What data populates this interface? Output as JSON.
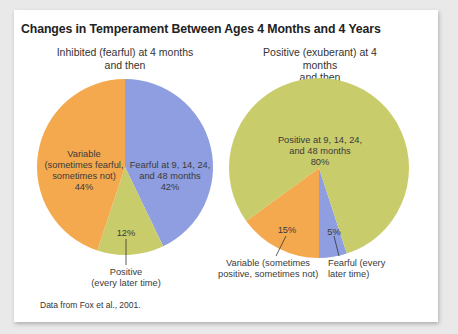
{
  "chart_data": [
    {
      "type": "pie",
      "title": "Changes in Temperament Between Ages 4 Months and 4 Years",
      "subtitle": "Inhibited (fearful) at 4 months and then",
      "slices": [
        {
          "label": "Fearful at 9, 14, 24, and 48 months",
          "value": 42,
          "color": "#8e9ee0"
        },
        {
          "label": "Positive (every later time)",
          "value": 12,
          "color": "#c9cc6a"
        },
        {
          "label": "Variable (sometimes fearful, sometimes not)",
          "value": 44,
          "color": "#f5a94e"
        }
      ]
    },
    {
      "type": "pie",
      "title": "Changes in Temperament Between Ages 4 Months and 4 Years",
      "subtitle": "Positive (exuberant) at 4 months and then",
      "slices": [
        {
          "label": "Positive at 9, 14, 24, and 48 months",
          "value": 80,
          "color": "#c9cc6a"
        },
        {
          "label": "Variable (sometimes positive, sometimes not)",
          "value": 15,
          "color": "#f5a94e"
        },
        {
          "label": "Fearful (every later time)",
          "value": 5,
          "color": "#8e9ee0"
        }
      ]
    }
  ],
  "figure": {
    "title": "Changes in Temperament Between Ages 4 Months and 4 Years",
    "source_note": "Data from Fox et al., 2001."
  },
  "left": {
    "subtitle_l1": "Inhibited (fearful) at 4 months",
    "subtitle_l2": "and then",
    "variable_l1": "Variable",
    "variable_l2": "(sometimes fearful,",
    "variable_l3": "sometimes not)",
    "variable_pct": "44%",
    "fearful_l1": "Fearful at 9, 14, 24,",
    "fearful_l2": "and 48 months",
    "fearful_pct": "42%",
    "positive_pct": "12%",
    "positive_l1": "Positive",
    "positive_l2": "(every later time)"
  },
  "right": {
    "subtitle_l1": "Positive (exuberant) at 4 months",
    "subtitle_l2": "and then",
    "positive_l1": "Positive at 9, 14, 24,",
    "positive_l2": "and 48 months",
    "positive_pct": "80%",
    "variable_pct": "15%",
    "variable_l1": "Variable (sometimes",
    "variable_l2": "positive, sometimes not)",
    "fearful_pct": "5%",
    "fearful_l1": "Fearful (every",
    "fearful_l2": "later time)"
  },
  "colors": {
    "blue": "#8e9ee0",
    "green": "#c9cc6a",
    "orange": "#f5a94e"
  }
}
